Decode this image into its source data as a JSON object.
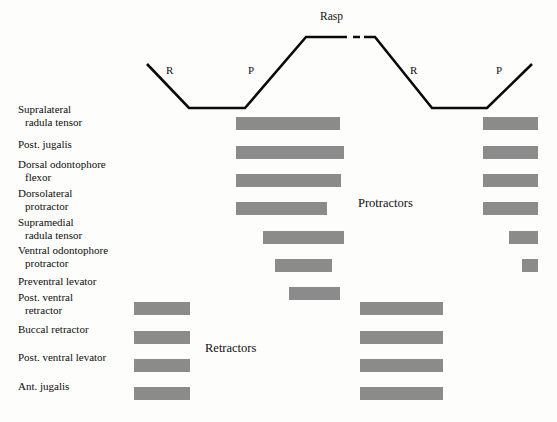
{
  "figure": {
    "bar_color": "#8b8b8b",
    "trace_color": "#0a0a0a",
    "background": "#fdfdfc"
  },
  "trace": {
    "rasp_label": "Rasp",
    "phase_labels": [
      {
        "text": "R",
        "x": 166,
        "y": 64
      },
      {
        "text": "P",
        "x": 248,
        "y": 64
      },
      {
        "text": "R",
        "x": 410,
        "y": 64
      },
      {
        "text": "P",
        "x": 496,
        "y": 64
      }
    ],
    "rasp_label_pos": {
      "x": 320,
      "y": 10
    },
    "solid_path": "M 147,64 L 189,108 L 245,108 L 306,37 L 340,37",
    "dashed_path": "M 340,37 L 364,37",
    "solid_path_2": "M 364,37 L 375,37 L 432,108 L 487,108 L 532,64",
    "stroke_width": 2.6
  },
  "groups": [
    {
      "label": "Protractors",
      "x": 358,
      "y": 196
    },
    {
      "label": "Retractors",
      "x": 205,
      "y": 341
    }
  ],
  "chart_data": {
    "type": "bar",
    "xlabel": "Feeding cycle phase",
    "ylabel": "Muscle",
    "legend": [
      "Protractors",
      "Retractors"
    ],
    "annotations": [
      "Rasp",
      "R",
      "P",
      "R",
      "P"
    ],
    "rows": [
      {
        "label_line1": "Supralateral",
        "label_line2": "radula tensor",
        "group": "Protractors",
        "label_y": 113,
        "bar_y": 117,
        "bars": [
          {
            "x": 236,
            "w": 104
          },
          {
            "x": 483,
            "w": 55
          }
        ]
      },
      {
        "label_line1": "Post. jugalis",
        "label_line2": "",
        "group": "Protractors",
        "label_y": 148,
        "bar_y": 146,
        "bars": [
          {
            "x": 236,
            "w": 108
          },
          {
            "x": 483,
            "w": 55
          }
        ]
      },
      {
        "label_line1": "Dorsal odontophore",
        "label_line2": "flexor",
        "group": "Protractors",
        "label_y": 168,
        "bar_y": 174,
        "bars": [
          {
            "x": 236,
            "w": 105
          },
          {
            "x": 483,
            "w": 55
          }
        ]
      },
      {
        "label_line1": "Dorsolateral",
        "label_line2": "protractor",
        "group": "Protractors",
        "label_y": 197,
        "bar_y": 202,
        "bars": [
          {
            "x": 236,
            "w": 91
          },
          {
            "x": 483,
            "w": 55
          }
        ]
      },
      {
        "label_line1": "Supramedial",
        "label_line2": "radula tensor",
        "group": "Protractors",
        "label_y": 226,
        "bar_y": 231,
        "bars": [
          {
            "x": 263,
            "w": 81
          },
          {
            "x": 509,
            "w": 29
          }
        ]
      },
      {
        "label_line1": "Ventral odontophore",
        "label_line2": "protractor",
        "group": "Protractors",
        "label_y": 254,
        "bar_y": 259,
        "bars": [
          {
            "x": 275,
            "w": 57
          },
          {
            "x": 522,
            "w": 16
          }
        ]
      },
      {
        "label_line1": "Preventral levator",
        "label_line2": "",
        "group": "Protractors",
        "label_y": 285,
        "bar_y": 287,
        "bars": [
          {
            "x": 289,
            "w": 51
          }
        ]
      },
      {
        "label_line1": "Post. ventral",
        "label_line2": "retractor",
        "group": "Retractors",
        "label_y": 301,
        "bar_y": 302,
        "bars": [
          {
            "x": 134,
            "w": 56
          },
          {
            "x": 360,
            "w": 83
          }
        ]
      },
      {
        "label_line1": "Buccal retractor",
        "label_line2": "",
        "group": "Retractors",
        "label_y": 333,
        "bar_y": 331,
        "bars": [
          {
            "x": 134,
            "w": 56
          },
          {
            "x": 360,
            "w": 83
          }
        ]
      },
      {
        "label_line1": "Post. ventral levator",
        "label_line2": "",
        "group": "Retractors",
        "label_y": 361,
        "bar_y": 359,
        "bars": [
          {
            "x": 134,
            "w": 56
          },
          {
            "x": 360,
            "w": 83
          }
        ]
      },
      {
        "label_line1": "Ant. jugalis",
        "label_line2": "",
        "group": "Retractors",
        "label_y": 390,
        "bar_y": 387,
        "bars": [
          {
            "x": 134,
            "w": 56
          },
          {
            "x": 360,
            "w": 83
          }
        ]
      }
    ]
  }
}
